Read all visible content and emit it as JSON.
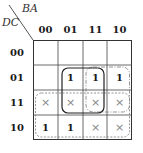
{
  "kmap": {
    "row_variable": "DC",
    "col_variable": "BA",
    "columns": [
      "00",
      "01",
      "11",
      "10"
    ],
    "rows": [
      {
        "label": "00",
        "cells": [
          "",
          "",
          "",
          ""
        ]
      },
      {
        "label": "01",
        "cells": [
          "",
          "1",
          "1",
          "1"
        ]
      },
      {
        "label": "11",
        "cells": [
          "×",
          "×",
          "×",
          "×"
        ]
      },
      {
        "label": "10",
        "cells": [
          "1",
          "1",
          "×",
          "×"
        ]
      }
    ],
    "groups": [
      {
        "name": "group-cols-01-11-rows-01-11",
        "style": "solid",
        "color": "#222222"
      },
      {
        "name": "group-cols-11-10-rows-01-11",
        "style": "dash-dot",
        "color": "#888888"
      },
      {
        "name": "group-rows-11-10",
        "style": "dashed",
        "color": "#888888"
      }
    ]
  }
}
